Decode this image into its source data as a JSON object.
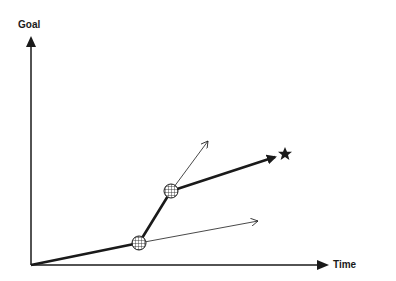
{
  "diagram": {
    "y_axis_label": "Goal",
    "x_axis_label": "Time",
    "goal_marker": "star-icon",
    "nodes": [
      {
        "id": "milestone-1",
        "pattern": "crosshatch"
      },
      {
        "id": "milestone-2",
        "pattern": "crosshatch"
      }
    ],
    "paths": [
      {
        "id": "actual-path",
        "style": "thick",
        "segments": [
          "origin->milestone-1",
          "milestone-1->milestone-2",
          "milestone-2->goal"
        ]
      },
      {
        "id": "alternate-path-1",
        "style": "thin",
        "from": "milestone-1"
      },
      {
        "id": "alternate-path-2",
        "style": "thin",
        "from": "milestone-2"
      }
    ],
    "colors": {
      "line": "#1a1a1a",
      "background": "#ffffff"
    }
  }
}
